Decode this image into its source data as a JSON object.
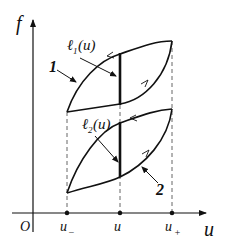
{
  "diagram": {
    "type": "hysteresis-loops",
    "axes": {
      "y_label": "f",
      "x_label": "u",
      "origin_label": "O"
    },
    "x_ticks": [
      {
        "label": "u",
        "sub": "−"
      },
      {
        "label": "u",
        "sub": ""
      },
      {
        "label": "u",
        "sub": "+"
      }
    ],
    "loops": [
      {
        "id": "1",
        "label": "1",
        "segment_label": "ℓ",
        "segment_sub": "1",
        "segment_arg": "(u)"
      },
      {
        "id": "2",
        "label": "2",
        "segment_label": "ℓ",
        "segment_sub": "2",
        "segment_arg": "(u)"
      }
    ],
    "colors": {
      "stroke": "#111111",
      "dashed": "#555555",
      "background": "#ffffff"
    }
  }
}
